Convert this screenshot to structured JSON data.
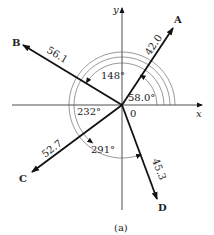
{
  "figure": {
    "caption": "(a)",
    "axes": {
      "x_label": "x",
      "y_label": "y",
      "origin_label": "0"
    },
    "vectors": [
      {
        "name": "A",
        "magnitude": "42.0",
        "angle": "58.0°"
      },
      {
        "name": "B",
        "magnitude": "56.1",
        "angle": "148°"
      },
      {
        "name": "C",
        "magnitude": "52.7",
        "angle": "232°"
      },
      {
        "name": "D",
        "magnitude": "45.3",
        "angle": "291°"
      }
    ],
    "colors": {
      "line": "#111111",
      "arc": "#555555",
      "text": "#222222",
      "background": "#ffffff"
    }
  }
}
